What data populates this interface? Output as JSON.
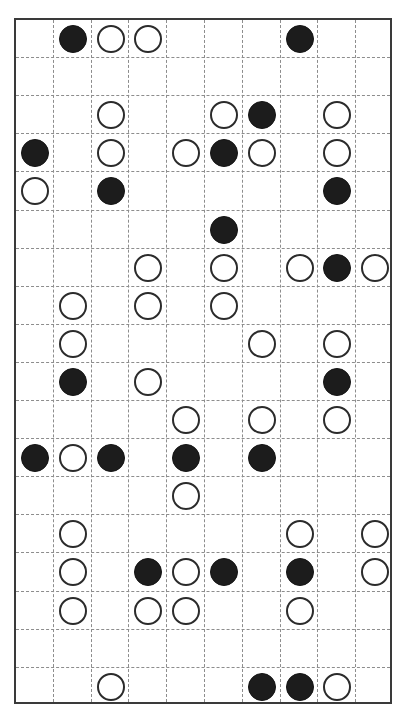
{
  "board": {
    "kind": "go-board-diagram",
    "columns": 10,
    "rows": 18,
    "origin_x": 14,
    "origin_y": 18,
    "cell_width": 37.8,
    "cell_height": 38.1,
    "stone_diameter": 28,
    "border_color": "#3a3a3a",
    "grid_color": "#8d8d8d",
    "grid_style": "dashed",
    "background_color": "#ffffff",
    "black_color": "#1c1c1c",
    "white_color": "#ffffff",
    "white_outline_color": "#2b2b2b",
    "legend": {
      "black_label": "black stone",
      "white_label": "white stone",
      "empty_label": "empty intersection"
    },
    "counts": {
      "black": 27,
      "white": 44,
      "total": 71
    },
    "stones": [
      {
        "row": 0,
        "col": 1,
        "color": "black"
      },
      {
        "row": 0,
        "col": 2,
        "color": "white"
      },
      {
        "row": 0,
        "col": 3,
        "color": "white"
      },
      {
        "row": 0,
        "col": 7,
        "color": "black"
      },
      {
        "row": 2,
        "col": 2,
        "color": "white"
      },
      {
        "row": 2,
        "col": 5,
        "color": "white"
      },
      {
        "row": 2,
        "col": 6,
        "color": "black"
      },
      {
        "row": 2,
        "col": 8,
        "color": "white"
      },
      {
        "row": 3,
        "col": 0,
        "color": "black"
      },
      {
        "row": 3,
        "col": 2,
        "color": "white"
      },
      {
        "row": 3,
        "col": 4,
        "color": "white"
      },
      {
        "row": 3,
        "col": 5,
        "color": "black"
      },
      {
        "row": 3,
        "col": 6,
        "color": "white"
      },
      {
        "row": 3,
        "col": 8,
        "color": "white"
      },
      {
        "row": 4,
        "col": 0,
        "color": "white"
      },
      {
        "row": 4,
        "col": 2,
        "color": "black"
      },
      {
        "row": 4,
        "col": 8,
        "color": "black"
      },
      {
        "row": 5,
        "col": 5,
        "color": "black"
      },
      {
        "row": 6,
        "col": 3,
        "color": "white"
      },
      {
        "row": 6,
        "col": 5,
        "color": "white"
      },
      {
        "row": 6,
        "col": 7,
        "color": "white"
      },
      {
        "row": 6,
        "col": 8,
        "color": "black"
      },
      {
        "row": 6,
        "col": 9,
        "color": "white"
      },
      {
        "row": 7,
        "col": 1,
        "color": "white"
      },
      {
        "row": 7,
        "col": 3,
        "color": "white"
      },
      {
        "row": 7,
        "col": 5,
        "color": "white"
      },
      {
        "row": 8,
        "col": 1,
        "color": "white"
      },
      {
        "row": 8,
        "col": 6,
        "color": "white"
      },
      {
        "row": 8,
        "col": 8,
        "color": "white"
      },
      {
        "row": 9,
        "col": 1,
        "color": "black"
      },
      {
        "row": 9,
        "col": 3,
        "color": "white"
      },
      {
        "row": 9,
        "col": 8,
        "color": "black"
      },
      {
        "row": 10,
        "col": 4,
        "color": "white"
      },
      {
        "row": 10,
        "col": 6,
        "color": "white"
      },
      {
        "row": 10,
        "col": 8,
        "color": "white"
      },
      {
        "row": 11,
        "col": 0,
        "color": "black"
      },
      {
        "row": 11,
        "col": 1,
        "color": "white"
      },
      {
        "row": 11,
        "col": 2,
        "color": "black"
      },
      {
        "row": 11,
        "col": 4,
        "color": "black"
      },
      {
        "row": 11,
        "col": 6,
        "color": "black"
      },
      {
        "row": 12,
        "col": 4,
        "color": "white"
      },
      {
        "row": 13,
        "col": 1,
        "color": "white"
      },
      {
        "row": 13,
        "col": 7,
        "color": "white"
      },
      {
        "row": 13,
        "col": 9,
        "color": "white"
      },
      {
        "row": 14,
        "col": 1,
        "color": "white"
      },
      {
        "row": 14,
        "col": 3,
        "color": "black"
      },
      {
        "row": 14,
        "col": 4,
        "color": "white"
      },
      {
        "row": 14,
        "col": 5,
        "color": "black"
      },
      {
        "row": 14,
        "col": 7,
        "color": "black"
      },
      {
        "row": 14,
        "col": 9,
        "color": "white"
      },
      {
        "row": 15,
        "col": 1,
        "color": "white"
      },
      {
        "row": 15,
        "col": 3,
        "color": "white"
      },
      {
        "row": 15,
        "col": 4,
        "color": "white"
      },
      {
        "row": 15,
        "col": 7,
        "color": "white"
      },
      {
        "row": 17,
        "col": 2,
        "color": "white"
      },
      {
        "row": 17,
        "col": 6,
        "color": "black"
      },
      {
        "row": 17,
        "col": 7,
        "color": "black"
      },
      {
        "row": 17,
        "col": 8,
        "color": "white"
      }
    ]
  }
}
